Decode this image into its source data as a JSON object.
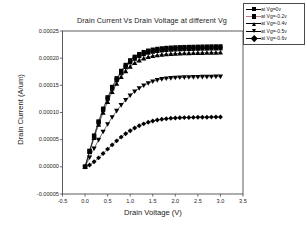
{
  "chart_data": {
    "type": "line",
    "title": "Drain Current Vs Drain Voltage at different Vg",
    "xlabel": "Drain Voltage (V)",
    "ylabel": "Drain Current (A/um)",
    "xlim": [
      -0.5,
      3.5
    ],
    "ylim": [
      -5e-05,
      0.00025
    ],
    "xticks": [
      "-0.5",
      "0.0",
      "0.5",
      "1.0",
      "1.5",
      "2.0",
      "2.5",
      "3.0",
      "3.5"
    ],
    "xtick_values": [
      -0.5,
      0.0,
      0.5,
      1.0,
      1.5,
      2.0,
      2.5,
      3.0,
      3.5
    ],
    "yticks": [
      "-0.00005",
      "0.00000",
      "0.00005",
      "0.00010",
      "0.00015",
      "0.00020",
      "0.00025"
    ],
    "ytick_values": [
      -5e-05,
      0.0,
      5e-05,
      0.0001,
      0.00015,
      0.0002,
      0.00025
    ],
    "grid": false,
    "legend_position": "top-right-outside",
    "x": [
      0.0,
      0.1,
      0.2,
      0.3,
      0.4,
      0.5,
      0.6,
      0.7,
      0.8,
      0.9,
      1.0,
      1.1,
      1.2,
      1.3,
      1.4,
      1.5,
      1.6,
      1.7,
      1.8,
      1.9,
      2.0,
      2.1,
      2.2,
      2.3,
      2.4,
      2.5,
      2.6,
      2.7,
      2.8,
      2.9,
      3.0
    ],
    "series": [
      {
        "name": "at Vg=0v",
        "marker": "square",
        "color": "#000000",
        "values": [
          0.0,
          2.95e-05,
          5.75e-05,
          8.35e-05,
          0.000107,
          0.000128,
          0.000147,
          0.000163,
          0.0001765,
          0.0001875,
          0.000196,
          0.0002025,
          0.0002075,
          0.0002112,
          0.0002138,
          0.0002156,
          0.000217,
          0.000218,
          0.0002188,
          0.0002193,
          0.0002198,
          0.0002201,
          0.0002204,
          0.0002206,
          0.0002208,
          0.000221,
          0.0002212,
          0.0002213,
          0.0002215,
          0.0002216,
          0.0002217
        ]
      },
      {
        "name": "at Vg=-0.2v",
        "marker": "square",
        "color": "#000000",
        "values": [
          0.0,
          2.88e-05,
          5.62e-05,
          8.18e-05,
          0.000105,
          0.0001255,
          0.0001442,
          0.00016,
          0.0001732,
          0.000184,
          0.0001925,
          0.000199,
          0.000204,
          0.0002076,
          0.0002102,
          0.000212,
          0.0002134,
          0.0002144,
          0.0002152,
          0.0002158,
          0.0002162,
          0.0002166,
          0.0002169,
          0.0002171,
          0.0002173,
          0.0002175,
          0.0002177,
          0.0002178,
          0.000218,
          0.0002181,
          0.0002182
        ]
      },
      {
        "name": "at Vg=-0.4v",
        "marker": "triangle-up",
        "color": "#000000",
        "values": [
          0.0,
          2.72e-05,
          5.32e-05,
          7.76e-05,
          9.98e-05,
          0.0001196,
          0.0001376,
          0.0001528,
          0.0001656,
          0.0001762,
          0.0001845,
          0.000191,
          0.000196,
          0.0001996,
          0.0002022,
          0.000204,
          0.0002054,
          0.0002064,
          0.0002072,
          0.0002078,
          0.0002083,
          0.0002087,
          0.000209,
          0.0002092,
          0.0002094,
          0.0002096,
          0.0002098,
          0.0002099,
          0.0002101,
          0.0002102,
          0.0002103
        ]
      },
      {
        "name": "at Vg=-0.5v",
        "marker": "triangle-down",
        "color": "#000000",
        "values": [
          0.0,
          1.72e-05,
          3.38e-05,
          4.96e-05,
          6.45e-05,
          7.84e-05,
          9.13e-05,
          0.000103,
          0.0001136,
          0.0001231,
          0.0001314,
          0.0001386,
          0.0001447,
          0.0001497,
          0.0001538,
          0.0001571,
          0.0001596,
          0.0001614,
          0.0001626,
          0.0001634,
          0.000164,
          0.0001644,
          0.0001647,
          0.000165,
          0.0001652,
          0.0001654,
          0.0001656,
          0.0001657,
          0.0001659,
          0.000166,
          0.0001661
        ]
      },
      {
        "name": "at Vg=-0.6v",
        "marker": "diamond",
        "color": "#000000",
        "values": [
          0.0,
          3.2e-06,
          9.2e-06,
          1.65e-05,
          2.45e-05,
          3.26e-05,
          4.04e-05,
          4.78e-05,
          5.47e-05,
          6.09e-05,
          6.65e-05,
          7.14e-05,
          7.56e-05,
          7.91e-05,
          8.2e-05,
          8.44e-05,
          8.62e-05,
          8.76e-05,
          8.86e-05,
          8.94e-05,
          8.99e-05,
          9.03e-05,
          9.06e-05,
          9.08e-05,
          9.1e-05,
          9.12e-05,
          9.13e-05,
          9.14e-05,
          9.15e-05,
          9.16e-05,
          9.17e-05
        ]
      }
    ]
  },
  "legend": {
    "items": [
      {
        "label": "at Vg=0v",
        "marker": "square"
      },
      {
        "label": "at Vg=-0.2v",
        "marker": "square"
      },
      {
        "label": "at Vg=-0.4v",
        "marker": "triangle-up"
      },
      {
        "label": "at Vg=-0.5v",
        "marker": "triangle-down"
      },
      {
        "label": "at Vg=-0.6v",
        "marker": "diamond"
      }
    ]
  },
  "colors": {
    "axis": "#4a4a4a",
    "text": "#1a1a1a",
    "data": "#000000",
    "background": "#ffffff"
  }
}
